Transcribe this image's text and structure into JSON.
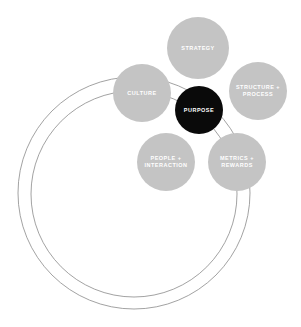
{
  "diagram": {
    "colors": {
      "node_fill": "#c4c4c4",
      "center_fill": "#0a0a0a",
      "ring_stroke": "#8a8a8a",
      "label_color": "#ffffff"
    },
    "center": {
      "label": "PURPOSE",
      "cx": 199,
      "cy": 110,
      "r": 24
    },
    "nodes": [
      {
        "id": "strategy",
        "lines": [
          "STRATEGY"
        ],
        "cx": 198,
        "cy": 48,
        "r": 31
      },
      {
        "id": "structure-process",
        "lines": [
          "STRUCTURE +",
          "PROCESS"
        ],
        "cx": 258,
        "cy": 91,
        "r": 29
      },
      {
        "id": "culture",
        "lines": [
          "CULTURE"
        ],
        "cx": 142,
        "cy": 93,
        "r": 29
      },
      {
        "id": "people-interaction",
        "lines": [
          "PEOPLE +",
          "INTERACTION"
        ],
        "cx": 166,
        "cy": 162,
        "r": 29
      },
      {
        "id": "metrics-rewards",
        "lines": [
          "METRICS +",
          "REWARDS"
        ],
        "cx": 237,
        "cy": 162,
        "r": 29
      }
    ],
    "rings": [
      {
        "id": "outer-ring",
        "cx": 134,
        "cy": 193,
        "r": 116
      },
      {
        "id": "inner-ring",
        "cx": 134,
        "cy": 194,
        "r": 103
      }
    ]
  }
}
